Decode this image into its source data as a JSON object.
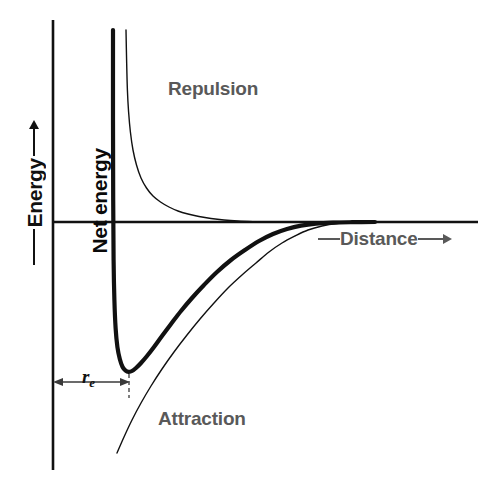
{
  "figure": {
    "background_color": "#ffffff",
    "curve_color": "#111111",
    "label_color": "#595959",
    "axis_color": "#111111"
  },
  "axes": {
    "x": {
      "label": "Distance",
      "arrow": "right",
      "leader_rule": true
    },
    "y": {
      "label": "Energy",
      "arrow": "up",
      "leader_rule": true
    }
  },
  "annotations": {
    "repulsion": "Repulsion",
    "attraction": "Attraction",
    "net_energy": "Net energy",
    "equilibrium_symbol": "r",
    "equilibrium_subscript": "e"
  },
  "chart_data": {
    "type": "line",
    "xlabel": "Distance",
    "ylabel": "Energy",
    "grid": false,
    "legend": "inline-annotations",
    "axis_origin": {
      "x": 53,
      "y": 222
    },
    "axis_extent": {
      "x_end": 478,
      "y_top": 20,
      "y_bottom": 470
    },
    "xlim": [
      0,
      1
    ],
    "ylim": [
      -1,
      1
    ],
    "equilibrium_distance_label": "re",
    "equilibrium_distance_px": 128,
    "minimum_energy_px": 372,
    "series": [
      {
        "name": "Repulsion",
        "style": "thin",
        "stroke_width": 1.4,
        "description": "Positive repulsive term decaying steeply toward zero with increasing distance",
        "points_px": [
          [
            126,
            30
          ],
          [
            126.6,
            60
          ],
          [
            127.4,
            90
          ],
          [
            128.6,
            112
          ],
          [
            130.4,
            132
          ],
          [
            133,
            150
          ],
          [
            136.5,
            165
          ],
          [
            141,
            178
          ],
          [
            146.5,
            188
          ],
          [
            153,
            196
          ],
          [
            160.5,
            202
          ],
          [
            169,
            207
          ],
          [
            178,
            211
          ],
          [
            188,
            214
          ],
          [
            199,
            216.5
          ],
          [
            211,
            218.5
          ],
          [
            224,
            220
          ],
          [
            238,
            221
          ],
          [
            253,
            221.6
          ],
          [
            270,
            222
          ],
          [
            290,
            222.2
          ]
        ]
      },
      {
        "name": "Attraction",
        "style": "thin",
        "stroke_width": 1.4,
        "description": "Negative attractive term rising asymptotically to zero with increasing distance",
        "points_px": [
          [
            117,
            453
          ],
          [
            124,
            437
          ],
          [
            132,
            420
          ],
          [
            141,
            403
          ],
          [
            151,
            386
          ],
          [
            162,
            369
          ],
          [
            174,
            352
          ],
          [
            187,
            335
          ],
          [
            200,
            319
          ],
          [
            214,
            303
          ],
          [
            228,
            288
          ],
          [
            242,
            275
          ],
          [
            256,
            263
          ],
          [
            269,
            252
          ],
          [
            282,
            243
          ],
          [
            295,
            236
          ],
          [
            308,
            230
          ],
          [
            322,
            226
          ],
          [
            337,
            223.6
          ],
          [
            355,
            222.4
          ],
          [
            375,
            222.1
          ]
        ]
      },
      {
        "name": "Net energy",
        "style": "thick",
        "stroke_width": 4.2,
        "description": "Sum of repulsive and attractive terms; steep wall at short range, minimum at re, asymptotic approach to zero",
        "points_px": [
          [
            113,
            30
          ],
          [
            113,
            120
          ],
          [
            113.2,
            200
          ],
          [
            113.6,
            260
          ],
          [
            114.4,
            300
          ],
          [
            115.6,
            328
          ],
          [
            117.4,
            347
          ],
          [
            119.8,
            359
          ],
          [
            122.6,
            367
          ],
          [
            125.6,
            370.6
          ],
          [
            128.6,
            371.8
          ],
          [
            132,
            371
          ],
          [
            136,
            368
          ],
          [
            141,
            363
          ],
          [
            147,
            356
          ],
          [
            154,
            347
          ],
          [
            162,
            336
          ],
          [
            171,
            324
          ],
          [
            181,
            311
          ],
          [
            192,
            298
          ],
          [
            204,
            285
          ],
          [
            217,
            272
          ],
          [
            231,
            260
          ],
          [
            245,
            250
          ],
          [
            259,
            241
          ],
          [
            273,
            234
          ],
          [
            287,
            229
          ],
          [
            301,
            225.6
          ],
          [
            316,
            223.6
          ],
          [
            333,
            222.6
          ],
          [
            352,
            222.2
          ],
          [
            375,
            222
          ]
        ]
      }
    ]
  }
}
